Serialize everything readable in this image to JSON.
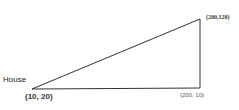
{
  "diagram": {
    "labels": {
      "house": "House",
      "origin": "(10, 20)",
      "top_right": "(200,120)",
      "bottom_right": "(200, 10)"
    },
    "vertices": [
      {
        "name": "house",
        "coord": "(10, 20)"
      },
      {
        "name": "top-right",
        "coord": "(200,120)"
      },
      {
        "name": "bottom-right",
        "coord": "(200, 10)"
      }
    ],
    "colors": {
      "line": "#333333",
      "background": "#ffffff"
    }
  }
}
